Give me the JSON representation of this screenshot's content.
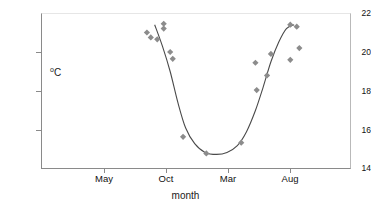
{
  "chart_data": {
    "type": "scatter",
    "title": "",
    "xlabel": "month",
    "ylabel": "oC",
    "ylabel_parts": {
      "degree": "o",
      "unit": "C"
    },
    "ylim": [
      14,
      22
    ],
    "xlim_months": [
      0,
      24
    ],
    "yticks": [
      14,
      16,
      18,
      20,
      22
    ],
    "ytick_labels": [
      "14",
      "16",
      "18",
      "20",
      "22"
    ],
    "xticks_months": [
      5,
      10,
      15,
      20
    ],
    "xtick_labels": [
      "May",
      "Oct",
      "Mar",
      "Aug"
    ],
    "grid": false,
    "legend": null,
    "series": [
      {
        "name": "observed temperature",
        "type": "scatter",
        "marker": "diamond",
        "color": "#8c8c8c",
        "points": [
          {
            "month": 8.2,
            "value": 21.0
          },
          {
            "month": 8.5,
            "value": 20.75
          },
          {
            "month": 9.0,
            "value": 20.65
          },
          {
            "month": 9.5,
            "value": 21.45
          },
          {
            "month": 9.5,
            "value": 21.2
          },
          {
            "month": 10.0,
            "value": 20.0
          },
          {
            "month": 10.2,
            "value": 19.65
          },
          {
            "month": 11.0,
            "value": 15.65
          },
          {
            "month": 12.8,
            "value": 14.8
          },
          {
            "month": 15.5,
            "value": 15.35
          },
          {
            "month": 16.6,
            "value": 19.45
          },
          {
            "month": 16.7,
            "value": 18.05
          },
          {
            "month": 17.5,
            "value": 18.8
          },
          {
            "month": 17.8,
            "value": 19.9
          },
          {
            "month": 19.3,
            "value": 21.4
          },
          {
            "month": 19.8,
            "value": 21.3
          },
          {
            "month": 19.3,
            "value": 19.6
          },
          {
            "month": 20.0,
            "value": 20.2
          }
        ]
      },
      {
        "name": "fitted seasonal curve",
        "type": "line",
        "color": "#4a4a4a",
        "points": [
          {
            "month": 8.8,
            "value": 21.4
          },
          {
            "month": 9.4,
            "value": 20.3
          },
          {
            "month": 10.0,
            "value": 19.0
          },
          {
            "month": 10.6,
            "value": 17.4
          },
          {
            "month": 11.2,
            "value": 16.1
          },
          {
            "month": 11.9,
            "value": 15.3
          },
          {
            "month": 12.7,
            "value": 14.85
          },
          {
            "month": 13.6,
            "value": 14.75
          },
          {
            "month": 14.4,
            "value": 14.85
          },
          {
            "month": 15.2,
            "value": 15.2
          },
          {
            "month": 15.9,
            "value": 15.9
          },
          {
            "month": 16.6,
            "value": 17.0
          },
          {
            "month": 17.2,
            "value": 18.2
          },
          {
            "month": 17.8,
            "value": 19.5
          },
          {
            "month": 18.4,
            "value": 20.5
          },
          {
            "month": 19.0,
            "value": 21.2
          },
          {
            "month": 19.6,
            "value": 21.4
          }
        ]
      }
    ]
  }
}
